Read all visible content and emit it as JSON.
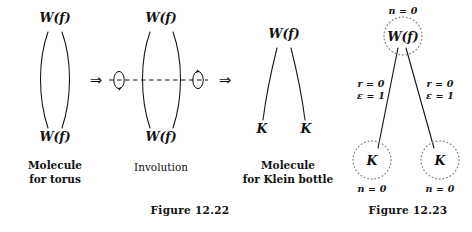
{
  "figure_22": {
    "caption": "Figure 12.22",
    "panels": [
      {
        "name": "molecule-for-torus",
        "top_vertex": "W(f)",
        "bottom_vertex": "W(f)",
        "caption_line1": "Molecule",
        "caption_line2": "for torus"
      },
      {
        "name": "involution",
        "top_vertex": "W(f)",
        "bottom_vertex": "W(f)",
        "caption_line1": "Involution",
        "caption_line2": ""
      },
      {
        "name": "molecule-for-klein-bottle",
        "top_vertex": "W(f)",
        "bottom_left_vertex": "K",
        "bottom_right_vertex": "K",
        "caption_line1": "Molecule",
        "caption_line2": "for Klein bottle"
      }
    ],
    "arrow_glyph": "⇒"
  },
  "figure_23": {
    "caption": "Figure 12.23",
    "root": {
      "label": "W(f)",
      "annotation": "n = 0"
    },
    "edges": [
      {
        "side": "left",
        "line1": "r = 0",
        "line2": "ε = 1"
      },
      {
        "side": "right",
        "line1": "r = 0",
        "line2": "ε = 1"
      }
    ],
    "leaves": [
      {
        "label": "K",
        "annotation": "n = 0"
      },
      {
        "label": "K",
        "annotation": "n = 0"
      }
    ]
  },
  "style": {
    "ink": "#111111",
    "dotted": "#7a7a7a"
  }
}
